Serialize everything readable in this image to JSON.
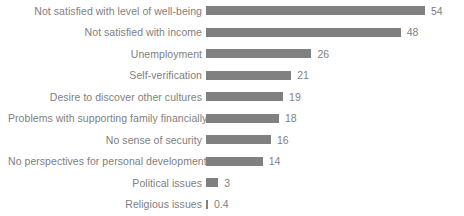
{
  "chart_data": {
    "type": "bar",
    "orientation": "horizontal",
    "title": "",
    "subtitle": "",
    "xlabel": "",
    "ylabel": "",
    "grid": false,
    "legend": null,
    "legend_position": "none",
    "axis_visible": false,
    "xlim": [
      0,
      54
    ],
    "bar_color": "#808080",
    "label_color": "#808080",
    "background": "#ffffff",
    "categories": [
      "Not satisfied with level of well-being",
      "Not satisfied with income",
      "Unemployment",
      "Self-verification",
      "Desire to discover other cultures",
      "Problems with supporting family financially",
      "No sense of security",
      "No perspectives for personal development",
      "Political issues",
      "Religious issues"
    ],
    "values": [
      54,
      48,
      26,
      21,
      19,
      18,
      16,
      14,
      3,
      0.4
    ],
    "value_labels": [
      "54",
      "48",
      "26",
      "21",
      "19",
      "18",
      "16",
      "14",
      "3",
      "0.4"
    ]
  }
}
